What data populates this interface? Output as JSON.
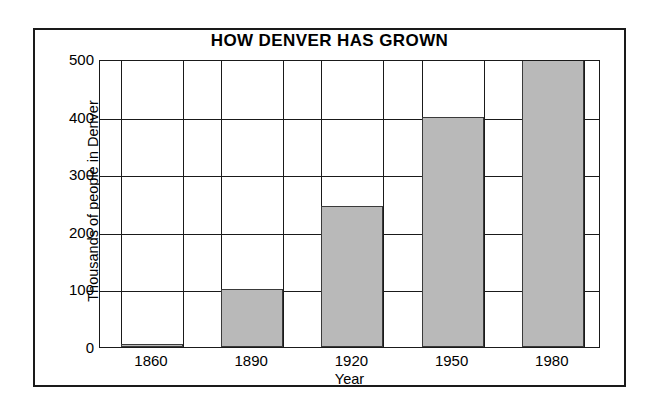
{
  "chart_data": {
    "type": "bar",
    "title": "HOW DENVER HAS GROWN",
    "xlabel": "Year",
    "ylabel": "Thousands of people in Denver",
    "categories": [
      "1860",
      "1890",
      "1920",
      "1950",
      "1980"
    ],
    "values": [
      5,
      100,
      245,
      400,
      500
    ],
    "ylim": [
      0,
      500
    ],
    "yticks": [
      "0",
      "100",
      "200",
      "300",
      "400",
      "500"
    ],
    "ytick_values": [
      0,
      100,
      200,
      300,
      400,
      500
    ],
    "grid": "horizontal-and-vertical",
    "legend": "none",
    "bar_fill_color": "#b9b9b9",
    "bar_edge_color": "#3a3a3a",
    "axis_color": "#1a1a1a",
    "background_color": "#ffffff"
  },
  "figure": {
    "frame_label": "chart-frame"
  }
}
